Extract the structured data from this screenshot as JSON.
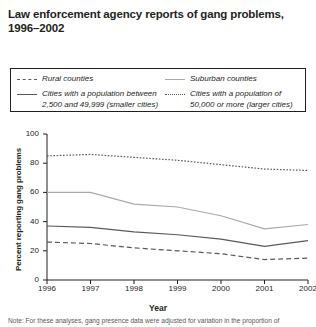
{
  "title": "Law enforcement agency reports of gang problems, 1996–2002",
  "legend": {
    "entries": [
      {
        "label": "Rural counties",
        "style": "dashed",
        "color": "#58595b"
      },
      {
        "label": "Suburban counties",
        "style": "solid-light",
        "color": "#a7a9ac"
      },
      {
        "label": "Cities with a population between\n2,500 and 49,999 (smaller cities)",
        "style": "solid-dark",
        "color": "#58595b"
      },
      {
        "label": "Cities with a population of\n50,000 or more (larger cities)",
        "style": "dotted",
        "color": "#58595b"
      }
    ]
  },
  "note": "Note: For these analyses, gang presence data were adjusted for variation in the proportion of",
  "chart_data": {
    "type": "line",
    "title": "Law enforcement agency reports of gang problems, 1996–2002",
    "xlabel": "Year",
    "ylabel": "Percent reporting gang problems",
    "x": [
      1996,
      1997,
      1998,
      1999,
      2000,
      2001,
      2002
    ],
    "categories": [
      "1996",
      "1997",
      "1998",
      "1999",
      "2000",
      "2001",
      "2002"
    ],
    "xlim": [
      1996,
      2002
    ],
    "ylim": [
      0,
      100
    ],
    "yticks": [
      0,
      20,
      40,
      60,
      80,
      100
    ],
    "grid": false,
    "legend_position": "top",
    "series": [
      {
        "name": "Cities with a population of 50,000 or more (larger cities)",
        "short_name": "larger cities",
        "style": "dotted",
        "color": "#58595b",
        "values": [
          85,
          86,
          84,
          82,
          79,
          76,
          75
        ]
      },
      {
        "name": "Suburban counties",
        "short_name": "suburban counties",
        "style": "solid-light",
        "color": "#a7a9ac",
        "values": [
          60,
          60,
          52,
          50,
          44,
          35,
          38
        ]
      },
      {
        "name": "Cities with a population between 2,500 and 49,999 (smaller cities)",
        "short_name": "smaller cities",
        "style": "solid-dark",
        "color": "#58595b",
        "values": [
          37,
          36,
          33,
          31,
          28,
          23,
          27
        ]
      },
      {
        "name": "Rural counties",
        "short_name": "rural counties",
        "style": "dashed",
        "color": "#58595b",
        "values": [
          26,
          25,
          22,
          20,
          18,
          14,
          15
        ]
      }
    ]
  }
}
